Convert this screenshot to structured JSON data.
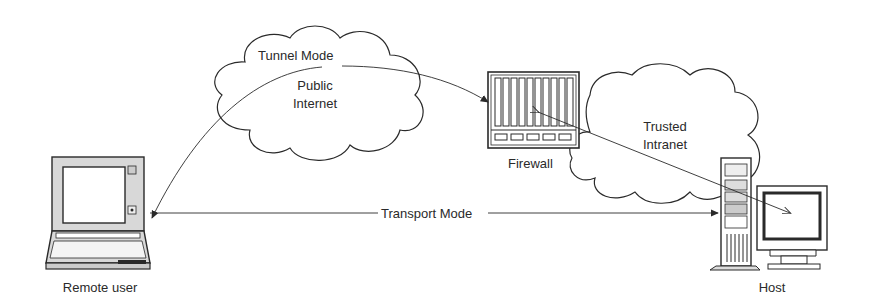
{
  "diagram": {
    "nodes": {
      "remote_user": {
        "label": "Remote user"
      },
      "host": {
        "label": "Host"
      },
      "firewall": {
        "label": "Firewall"
      },
      "public_internet": {
        "label_line1": "Public",
        "label_line2": "Internet"
      },
      "trusted_intranet": {
        "label_line1": "Trusted",
        "label_line2": "Intranet"
      }
    },
    "connections": {
      "tunnel_mode": {
        "label": "Tunnel Mode"
      },
      "transport_mode": {
        "label": "Transport Mode"
      }
    },
    "colors": {
      "stroke": "#2a2a2a",
      "background": "#ffffff"
    }
  }
}
